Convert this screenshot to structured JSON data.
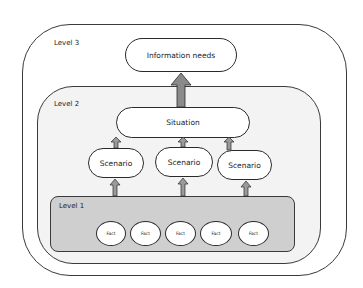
{
  "diagram": {
    "levels": [
      {
        "id": "level3",
        "label": "Level 3"
      },
      {
        "id": "level2",
        "label": "Level 2"
      },
      {
        "id": "level1",
        "label": "Level 1"
      }
    ],
    "nodes": {
      "information_needs": "Information needs",
      "situation": "Situation",
      "scenarios": [
        "Scenario",
        "Scenario",
        "Scenario"
      ],
      "facts": [
        "Fact",
        "Fact",
        "Fact",
        "Fact",
        "Fact"
      ]
    },
    "edges": [
      {
        "from": "level1",
        "to": "scenario-1"
      },
      {
        "from": "level1",
        "to": "scenario-2"
      },
      {
        "from": "level1",
        "to": "scenario-3"
      },
      {
        "from": "scenario-1",
        "to": "situation"
      },
      {
        "from": "scenario-2",
        "to": "situation"
      },
      {
        "from": "scenario-3",
        "to": "situation"
      },
      {
        "from": "situation",
        "to": "information_needs"
      }
    ],
    "colors": {
      "level1_fill": "#cfcfcf",
      "level2_fill": "#f3f3f3",
      "level3_fill": "#ffffff",
      "arrow_fill": "#8a8a8a",
      "stroke": "#2a2a2a"
    }
  }
}
